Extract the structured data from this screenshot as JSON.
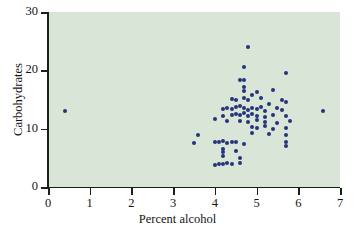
{
  "chart_data": {
    "type": "scatter",
    "title": "",
    "xlabel": "Percent alcohol",
    "ylabel": "Carbohydrates",
    "xlim": [
      0,
      7
    ],
    "ylim": [
      0,
      30
    ],
    "xticks": [
      0,
      1,
      2,
      3,
      4,
      5,
      6,
      7
    ],
    "yticks": [
      0,
      10,
      20,
      30
    ],
    "xtick_labels": [
      "0",
      "1",
      "2",
      "3",
      "4",
      "5",
      "6",
      "7"
    ],
    "ytick_labels": [
      "0",
      "10",
      "20",
      "30"
    ],
    "grid": false,
    "legend": null,
    "marker_color": "#26357a",
    "plot_background": "#d8e5d7",
    "figure_background": "#ffffff",
    "points": [
      [
        0.4,
        13.0
      ],
      [
        4.8,
        24.0
      ],
      [
        4.7,
        20.5
      ],
      [
        4.6,
        18.3
      ],
      [
        4.7,
        18.3
      ],
      [
        5.7,
        19.6
      ],
      [
        4.7,
        17.1
      ],
      [
        4.7,
        16.4
      ],
      [
        4.9,
        15.8
      ],
      [
        5.0,
        16.3
      ],
      [
        5.4,
        16.6
      ],
      [
        4.4,
        15.1
      ],
      [
        4.5,
        15.0
      ],
      [
        4.7,
        15.2
      ],
      [
        4.8,
        14.9
      ],
      [
        5.1,
        15.3
      ],
      [
        5.3,
        14.2
      ],
      [
        5.6,
        15.0
      ],
      [
        5.7,
        14.6
      ],
      [
        4.2,
        13.4
      ],
      [
        4.3,
        13.6
      ],
      [
        4.4,
        13.4
      ],
      [
        4.5,
        13.7
      ],
      [
        4.6,
        13.9
      ],
      [
        4.7,
        13.6
      ],
      [
        4.8,
        13.2
      ],
      [
        4.9,
        13.5
      ],
      [
        5.0,
        13.3
      ],
      [
        5.1,
        13.8
      ],
      [
        5.2,
        13.1
      ],
      [
        5.5,
        13.5
      ],
      [
        5.6,
        13.2
      ],
      [
        6.6,
        13.0
      ],
      [
        4.2,
        12.2
      ],
      [
        4.4,
        12.4
      ],
      [
        4.5,
        12.6
      ],
      [
        4.6,
        12.3
      ],
      [
        4.7,
        12.7
      ],
      [
        4.8,
        12.1
      ],
      [
        4.9,
        12.5
      ],
      [
        5.0,
        12.2
      ],
      [
        5.2,
        12.0
      ],
      [
        5.4,
        12.3
      ],
      [
        5.7,
        12.1
      ],
      [
        4.0,
        11.6
      ],
      [
        4.3,
        11.4
      ],
      [
        4.6,
        11.3
      ],
      [
        4.8,
        11.1
      ],
      [
        5.0,
        11.5
      ],
      [
        5.2,
        11.2
      ],
      [
        5.5,
        11.0
      ],
      [
        5.8,
        11.4
      ],
      [
        4.9,
        10.3
      ],
      [
        5.0,
        10.1
      ],
      [
        5.2,
        10.4
      ],
      [
        5.4,
        10.0
      ],
      [
        5.7,
        10.2
      ],
      [
        3.6,
        9.0
      ],
      [
        4.9,
        9.3
      ],
      [
        5.3,
        9.1
      ],
      [
        5.7,
        9.0
      ],
      [
        3.5,
        7.6
      ],
      [
        4.0,
        7.8
      ],
      [
        4.1,
        7.7
      ],
      [
        4.2,
        7.9
      ],
      [
        4.3,
        7.6
      ],
      [
        4.4,
        7.8
      ],
      [
        4.5,
        7.7
      ],
      [
        4.7,
        7.4
      ],
      [
        5.7,
        7.8
      ],
      [
        5.7,
        7.0
      ],
      [
        4.2,
        6.5
      ],
      [
        4.2,
        6.0
      ],
      [
        4.5,
        6.2
      ],
      [
        4.2,
        5.4
      ],
      [
        4.6,
        5.0
      ],
      [
        4.1,
        4.0
      ],
      [
        4.2,
        3.9
      ],
      [
        4.3,
        4.1
      ],
      [
        4.4,
        4.0
      ],
      [
        4.6,
        4.2
      ],
      [
        4.0,
        3.8
      ]
    ]
  }
}
